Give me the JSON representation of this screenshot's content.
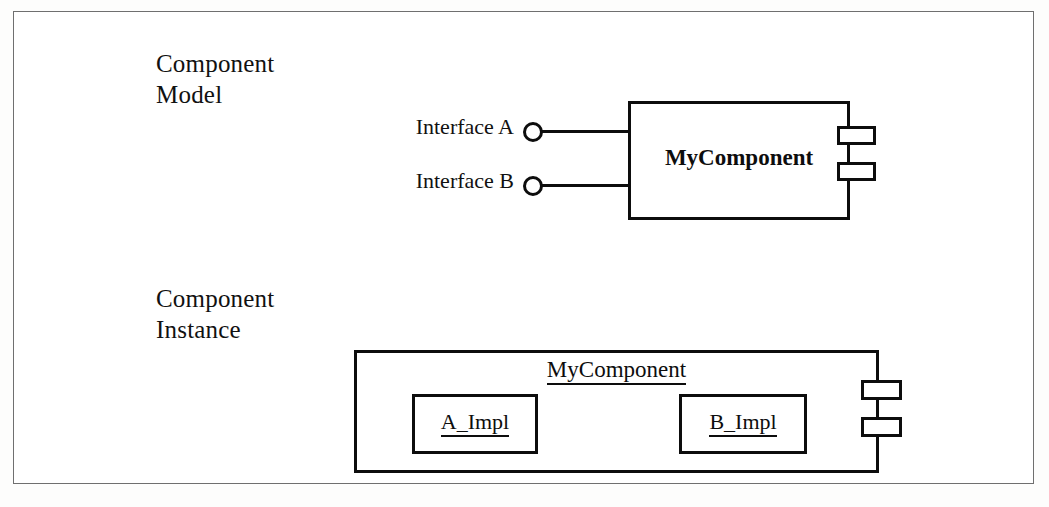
{
  "diagram": {
    "type": "uml-component-diagram",
    "sections": [
      {
        "caption": "Component\nModel",
        "component": {
          "name": "MyComponent",
          "style": "bold",
          "underlined": false,
          "tabs": 2,
          "tab_side": "right"
        },
        "interfaces": [
          {
            "label": "Interface A",
            "notation": "lollipop"
          },
          {
            "label": "Interface B",
            "notation": "lollipop"
          }
        ]
      },
      {
        "caption": "Component\nInstance",
        "component": {
          "name": "MyComponent",
          "style": "regular",
          "underlined": true,
          "tabs": 2,
          "tab_side": "right"
        },
        "parts": [
          {
            "label": "A_Impl",
            "underlined": true
          },
          {
            "label": "B_Impl",
            "underlined": true
          }
        ]
      }
    ]
  },
  "colors": {
    "stroke": "#0d0d0d",
    "page_border": "#6f6f6f",
    "background": "#ffffff",
    "text": "#111111"
  }
}
